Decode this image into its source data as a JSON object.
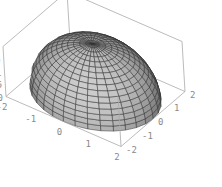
{
  "chart_data": {
    "type": "surface3d",
    "title": "",
    "function": "z = sqrt(4 - x^2 - y^2)",
    "radius": 2,
    "x_range": [
      -2,
      2
    ],
    "y_range": [
      -2,
      2
    ],
    "z_range": [
      0,
      2
    ],
    "x_ticks": [
      "-2",
      "-1",
      "0",
      "1",
      "2"
    ],
    "y_ticks": [
      "-2",
      "-1",
      "0",
      "1",
      "2"
    ],
    "z_ticks": [
      "0",
      "0.5",
      "1",
      "1.5",
      "2"
    ],
    "mesh": {
      "latitude_bands": 16,
      "longitude_segments": 32
    },
    "colors": {
      "surface": "#b4b4b4",
      "mesh": "#2e2e2e",
      "box": "#a9a9a9",
      "tick_label": "#8a8a8a"
    },
    "grid": false,
    "legend": null
  }
}
